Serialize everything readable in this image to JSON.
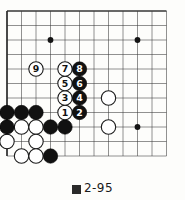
{
  "figure": {
    "caption": "2-95",
    "caption_mark": "figure-char",
    "caption_full": "図2-95"
  },
  "board": {
    "cols": 12,
    "rows": 11,
    "origin_x": 7,
    "origin_y": 11,
    "spacing": 14.5,
    "line_color": "#3a3a3a",
    "edge_color": "#2a2a2a",
    "background": "#fdfdfb",
    "star_points": [
      {
        "col": 3,
        "row": 2
      },
      {
        "col": 9,
        "row": 2
      },
      {
        "col": 9,
        "row": 8
      }
    ]
  },
  "stones": {
    "black_color": "#111111",
    "white_color": "#ffffff",
    "white_edge": "#1a1a1a",
    "radius": 7.2,
    "plain_black": [
      {
        "col": 0,
        "row": 7
      },
      {
        "col": 1,
        "row": 7
      },
      {
        "col": 2,
        "row": 7
      },
      {
        "col": 0,
        "row": 8
      },
      {
        "col": 3,
        "row": 8
      },
      {
        "col": 4,
        "row": 8
      },
      {
        "col": 3,
        "row": 10
      }
    ],
    "plain_white": [
      {
        "col": 1,
        "row": 8
      },
      {
        "col": 2,
        "row": 8
      },
      {
        "col": 0,
        "row": 9
      },
      {
        "col": 2,
        "row": 9
      },
      {
        "col": 1,
        "row": 10
      },
      {
        "col": 2,
        "row": 10
      },
      {
        "col": 7,
        "row": 6
      },
      {
        "col": 7,
        "row": 8
      }
    ],
    "numbered": [
      {
        "label": "1",
        "color": "black",
        "col": 4,
        "row": 7,
        "stone": "white"
      },
      {
        "label": "2",
        "color": "white",
        "col": 5,
        "row": 7,
        "stone": "black"
      },
      {
        "label": "3",
        "color": "black",
        "col": 4,
        "row": 6,
        "stone": "white"
      },
      {
        "label": "4",
        "color": "white",
        "col": 5,
        "row": 6,
        "stone": "black"
      },
      {
        "label": "5",
        "color": "black",
        "col": 4,
        "row": 5,
        "stone": "white"
      },
      {
        "label": "6",
        "color": "white",
        "col": 5,
        "row": 5,
        "stone": "black"
      },
      {
        "label": "7",
        "color": "black",
        "col": 4,
        "row": 4,
        "stone": "white"
      },
      {
        "label": "8",
        "color": "white",
        "col": 5,
        "row": 4,
        "stone": "black"
      },
      {
        "label": "9",
        "color": "black",
        "col": 2,
        "row": 4,
        "stone": "white"
      }
    ]
  }
}
